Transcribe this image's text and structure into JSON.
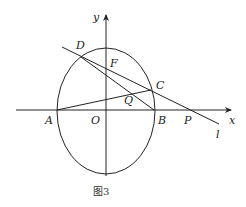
{
  "figure": {
    "caption": "图3",
    "axes": {
      "x_label": "x",
      "y_label": "y"
    },
    "points": {
      "A": "A",
      "B": "B",
      "C": "C",
      "D": "D",
      "F": "F",
      "O": "O",
      "P": "P",
      "Q": "Q"
    },
    "line_label": "l",
    "colors": {
      "stroke": "#222222",
      "background": "#ffffff"
    }
  }
}
